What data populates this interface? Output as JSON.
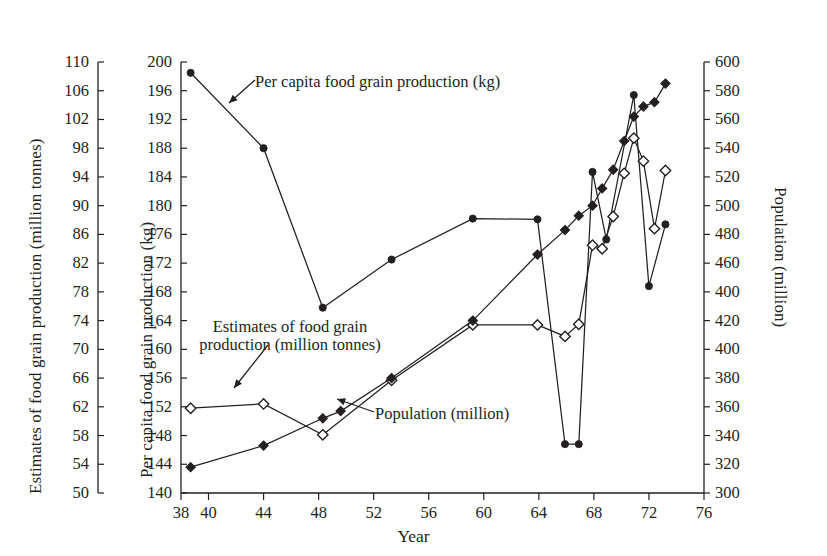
{
  "chart_data": {
    "type": "line",
    "title": "",
    "xlabel": "Year",
    "axes": {
      "x": {
        "label": "Year",
        "min": 38,
        "max": 76,
        "ticks": [
          38,
          40,
          44,
          48,
          52,
          56,
          60,
          64,
          68,
          72,
          76
        ],
        "tick_labels": [
          "38",
          "40",
          "44",
          "48",
          "52",
          "56",
          "60",
          "64",
          "68",
          "72",
          "76"
        ]
      },
      "y_outer_left": {
        "label": "Estimates of food grain production (million tonnes)",
        "min": 50,
        "max": 110,
        "step": 4,
        "tick_labels": [
          "110",
          "106",
          "102",
          "98",
          "94",
          "90",
          "86",
          "82",
          "78",
          "74",
          "70",
          "66",
          "62",
          "58",
          "54",
          "50"
        ]
      },
      "y_inner_left": {
        "label": "Per capita food grain production (kg)",
        "min": 140,
        "max": 200,
        "step": 4,
        "tick_labels": [
          "200",
          "196",
          "192",
          "188",
          "184",
          "180",
          "176",
          "172",
          "168",
          "164",
          "160",
          "156",
          "152",
          "148",
          "144",
          "140"
        ]
      },
      "y_right": {
        "label": "Population (million)",
        "min": 300,
        "max": 600,
        "step": 20,
        "tick_labels": [
          "600",
          "580",
          "560",
          "540",
          "520",
          "500",
          "480",
          "460",
          "400",
          "420",
          "400",
          "380",
          "360",
          "340",
          "320",
          "300"
        ]
      },
      "grid": false,
      "legend": "inline annotations"
    },
    "series": [
      {
        "name": "Per capita food grain production (kg)",
        "axis": "y_inner_left",
        "unit": "kg",
        "marker": "filled-circle",
        "line": "solid",
        "points": [
          {
            "x": 38.7,
            "y": 198.5
          },
          {
            "x": 44.0,
            "y": 188.0
          },
          {
            "x": 48.3,
            "y": 165.8
          },
          {
            "x": 53.3,
            "y": 172.5
          },
          {
            "x": 59.2,
            "y": 178.2
          },
          {
            "x": 63.9,
            "y": 178.1
          },
          {
            "x": 65.9,
            "y": 146.8
          },
          {
            "x": 66.9,
            "y": 146.8
          },
          {
            "x": 67.9,
            "y": 184.7
          },
          {
            "x": 68.9,
            "y": 175.3
          },
          {
            "x": 70.9,
            "y": 195.4
          },
          {
            "x": 72.0,
            "y": 168.8
          },
          {
            "x": 73.2,
            "y": 177.4
          }
        ]
      },
      {
        "name": "Estimates of food grain production (million tonnes)",
        "axis": "y_outer_left",
        "unit": "million tonnes",
        "marker": "open-diamond",
        "line": "solid-thin",
        "points": [
          {
            "x": 38.7,
            "y": 61.8
          },
          {
            "x": 44.0,
            "y": 62.4
          },
          {
            "x": 48.3,
            "y": 58.1
          },
          {
            "x": 53.3,
            "y": 65.7
          },
          {
            "x": 59.2,
            "y": 73.4
          },
          {
            "x": 63.9,
            "y": 73.4
          },
          {
            "x": 65.9,
            "y": 71.8
          },
          {
            "x": 66.9,
            "y": 73.5
          },
          {
            "x": 67.9,
            "y": 84.5
          },
          {
            "x": 68.6,
            "y": 84.0
          },
          {
            "x": 69.4,
            "y": 88.5
          },
          {
            "x": 70.2,
            "y": 94.5
          },
          {
            "x": 70.9,
            "y": 99.4
          },
          {
            "x": 71.6,
            "y": 96.2
          },
          {
            "x": 72.4,
            "y": 86.8
          },
          {
            "x": 73.2,
            "y": 94.9
          }
        ]
      },
      {
        "name": "Population (million)",
        "axis": "y_right",
        "unit": "million",
        "marker": "filled-diamond",
        "line": "solid",
        "points": [
          {
            "x": 38.7,
            "y": 318
          },
          {
            "x": 44.0,
            "y": 333
          },
          {
            "x": 48.3,
            "y": 352
          },
          {
            "x": 49.6,
            "y": 357
          },
          {
            "x": 53.3,
            "y": 380
          },
          {
            "x": 59.2,
            "y": 420
          },
          {
            "x": 63.9,
            "y": 466
          },
          {
            "x": 65.9,
            "y": 483
          },
          {
            "x": 66.9,
            "y": 493
          },
          {
            "x": 67.9,
            "y": 500
          },
          {
            "x": 68.6,
            "y": 512
          },
          {
            "x": 69.4,
            "y": 525
          },
          {
            "x": 70.2,
            "y": 545
          },
          {
            "x": 70.9,
            "y": 562
          },
          {
            "x": 71.6,
            "y": 569
          },
          {
            "x": 72.4,
            "y": 572
          },
          {
            "x": 73.2,
            "y": 585
          }
        ]
      }
    ],
    "annotations": [
      {
        "id": "annot-percapita",
        "text": "Per capita food grain production (kg)"
      },
      {
        "id": "annot-foodgrain",
        "line1": "Estimates of food grain",
        "line2": "production (million tonnes)"
      },
      {
        "id": "annot-population",
        "text": "Population (million)"
      }
    ]
  },
  "labels": {
    "outer_left_title": "Estimates of food grain production (million tonnes)",
    "inner_left_title": "Per capita food grain production (kg)",
    "right_title": "Population (million)",
    "x_title": "Year",
    "annot_percapita": "Per capita food grain production (kg)",
    "annot_foodgrain_l1": "Estimates of food grain",
    "annot_foodgrain_l2": "production (million tonnes)",
    "annot_population": "Population (million)"
  },
  "colors": {
    "ink": "#231f20",
    "background": "#ffffff"
  }
}
